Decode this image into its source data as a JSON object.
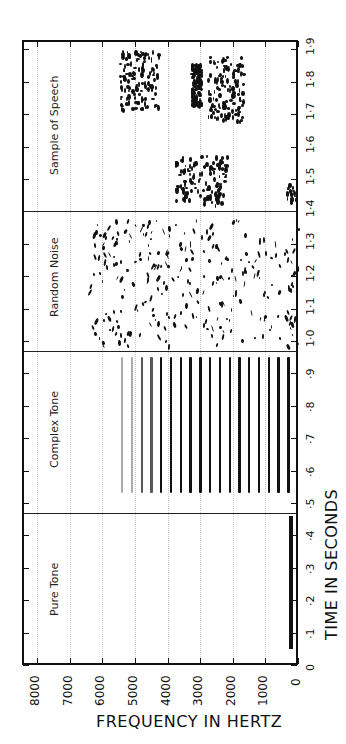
{
  "chart_data": {
    "type": "heatmap",
    "xlabel": "FREQUENCY IN HERTZ",
    "ylabel": "TIME IN SECONDS",
    "orientation": "rotated 90° (frequency on horizontal axis decreasing left-to-right, time on vertical axis increasing bottom-to-top)",
    "frequency_ticks": [
      "8000",
      "7000",
      "6000",
      "5000",
      "4000",
      "3000",
      "2000",
      "1000",
      "0"
    ],
    "frequency_range_hz": [
      0,
      8300
    ],
    "time_ticks": [
      "0",
      "·1",
      "·2",
      "·3",
      "·4",
      "·5",
      "·6",
      "·7",
      "·8",
      "·9",
      "1·0",
      "1·1",
      "1·2",
      "1·3",
      "1·4",
      "1·5",
      "1·6",
      "1·7",
      "1·8",
      "1·9"
    ],
    "time_range_s": [
      0,
      1.93
    ],
    "grid": "dotted vertical lines every 1000 Hz",
    "panels": [
      {
        "name": "Pure Tone",
        "time_range_s": [
          0.0,
          0.47
        ],
        "content": "single steady tone",
        "frequency_hz": 200,
        "tone_time_s": [
          0.05,
          0.46
        ]
      },
      {
        "name": "Complex Tone",
        "time_range_s": [
          0.47,
          0.97
        ],
        "content": "harmonic series",
        "fundamental_hz": 300,
        "harmonics_hz": [
          300,
          600,
          900,
          1200,
          1500,
          1800,
          2100,
          2400,
          2700,
          3000,
          3300,
          3600,
          3900,
          4200,
          4500,
          4800,
          5100,
          5400
        ],
        "tone_time_s": [
          0.53,
          0.95
        ]
      },
      {
        "name": "Random Noise",
        "time_range_s": [
          0.97,
          1.4
        ],
        "content": "broadband scattered energy",
        "frequency_span_hz": [
          0,
          6500
        ]
      },
      {
        "name": "Sample of Speech",
        "time_range_s": [
          1.4,
          1.93
        ],
        "content": "formant energy clusters",
        "clusters": [
          {
            "time_s": [
              1.42,
              1.58
            ],
            "frequency_hz": [
              2200,
              3800
            ]
          },
          {
            "time_s": [
              1.43,
              1.49
            ],
            "frequency_hz": [
              100,
              400
            ]
          },
          {
            "time_s": [
              1.68,
              1.88
            ],
            "frequency_hz": [
              1700,
              2800
            ]
          },
          {
            "time_s": [
              1.72,
              1.9
            ],
            "frequency_hz": [
              4300,
              5500
            ]
          },
          {
            "time_s": [
              1.73,
              1.86
            ],
            "frequency_hz": [
              3000,
              3300
            ]
          }
        ]
      }
    ]
  },
  "layout": {
    "frame": {
      "left": 22,
      "top": 40,
      "width": 276,
      "height": 625
    },
    "px_per_1000hz": 32.6,
    "px_per_01s": 32.4
  }
}
